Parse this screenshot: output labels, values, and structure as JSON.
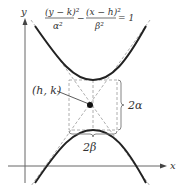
{
  "equation": {
    "term1_num": "(y − k)²",
    "term1_den": "α²",
    "minus": "−",
    "term2_num": "(x − h)²",
    "term2_den": "β²",
    "rhs": "= 1"
  },
  "axes": {
    "x_label": "x",
    "y_label": "y"
  },
  "labels": {
    "center": "(h, k)",
    "vertical_span": "2α",
    "horizontal_span": "2β"
  },
  "colors": {
    "curve": "#222222",
    "dashed": "#999999",
    "axis": "#555555",
    "text": "#333333"
  }
}
